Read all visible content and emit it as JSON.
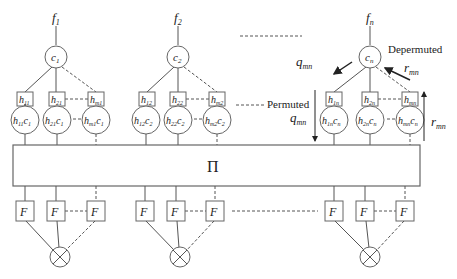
{
  "diagram": {
    "permutation_label": "Π",
    "groups": [
      {
        "f": "f",
        "f_sub": "1",
        "c": "c",
        "c_sub": "1",
        "h": [
          {
            "label": "h",
            "sub": "11"
          },
          {
            "label": "h",
            "sub": "21"
          },
          {
            "label": "h",
            "sub": "m1"
          }
        ],
        "hc": [
          {
            "h_sub": "11",
            "c_sub": "1"
          },
          {
            "h_sub": "21",
            "c_sub": "1"
          },
          {
            "h_sub": "m1",
            "c_sub": "1"
          }
        ],
        "F": [
          "F",
          "F",
          "F"
        ]
      },
      {
        "f": "f",
        "f_sub": "2",
        "c": "c",
        "c_sub": "2",
        "h": [
          {
            "label": "h",
            "sub": "12"
          },
          {
            "label": "h",
            "sub": "22"
          },
          {
            "label": "h",
            "sub": "m2"
          }
        ],
        "hc": [
          {
            "h_sub": "12",
            "c_sub": "2"
          },
          {
            "h_sub": "22",
            "c_sub": "2"
          },
          {
            "h_sub": "m2",
            "c_sub": "2"
          }
        ],
        "F": [
          "F",
          "F",
          "F"
        ]
      },
      {
        "f": "f",
        "f_sub": "n",
        "c": "c",
        "c_sub": "n",
        "h": [
          {
            "label": "h",
            "sub": "1n"
          },
          {
            "label": "h",
            "sub": "2n"
          },
          {
            "label": "h",
            "sub": "mn"
          }
        ],
        "hc": [
          {
            "h_sub": "1n",
            "c_sub": "n"
          },
          {
            "h_sub": "2n",
            "c_sub": "n"
          },
          {
            "h_sub": "mn",
            "c_sub": "n"
          }
        ],
        "F": [
          "F",
          "F",
          "F"
        ]
      }
    ],
    "annotations": {
      "q_top": "q",
      "q_top_sub": "mn",
      "depermuted": "Depermuted",
      "r_top": "r",
      "r_top_sub": "mn",
      "permuted": "Permuted",
      "q_mid": "q",
      "q_mid_sub": "mn",
      "r_right": "r",
      "r_right_sub": "mn"
    }
  }
}
